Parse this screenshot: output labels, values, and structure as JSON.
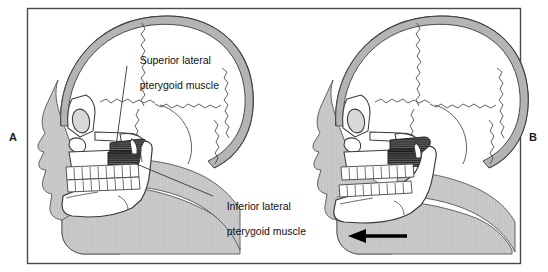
{
  "figure": {
    "type": "anatomical-illustration",
    "frame": {
      "border_color": "#4a4a4a",
      "background": "#ffffff"
    },
    "colors": {
      "soft_tissue": "#c8c8c8",
      "bone_fill": "#ffffff",
      "bone_outline": "#3a3a3a",
      "muscle_fiber": "#1c1c1c",
      "cranium_band": "#b4b4b4",
      "arrow": "#000000",
      "text": "#111111"
    }
  },
  "panels": [
    {
      "id": "A",
      "letter": "A",
      "description": "Skull in profile with mandible in closed / rest position, showing the two heads of the lateral pterygoid muscle",
      "labels": [
        {
          "name": "superior-lateral-pterygoid",
          "line1": "Superior lateral",
          "line2": "pterygoid muscle"
        },
        {
          "name": "inferior-lateral-pterygoid",
          "line1": "Inferior lateral",
          "line2": "pterygoid muscle"
        }
      ]
    },
    {
      "id": "B",
      "letter": "B",
      "description": "Skull in profile with mandible protruded forward; dashed outline marks the original closed position",
      "arrow": {
        "name": "protrusion-arrow",
        "direction": "left",
        "meaning": "anterior mandibular translation"
      },
      "labels": []
    }
  ]
}
